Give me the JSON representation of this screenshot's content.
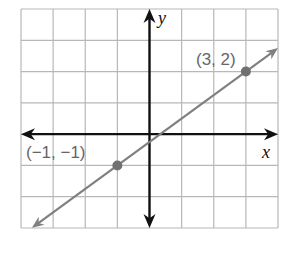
{
  "chart_data": {
    "type": "line",
    "title": "",
    "xlabel": "x",
    "ylabel": "y",
    "xlim": [
      -4,
      4
    ],
    "ylim": [
      -3,
      4
    ],
    "grid": true,
    "axes_arrows": true,
    "series": [
      {
        "name": "line through (-1,-1) and (3,2)",
        "equation": "y = 0.75x - 0.25",
        "slope": 0.75,
        "intercept": -0.25,
        "arrows": "both",
        "color": "#808080",
        "points": [
          {
            "x": -1,
            "y": -1,
            "label": "(−1, −1)"
          },
          {
            "x": 3,
            "y": 2,
            "label": "(3, 2)"
          }
        ]
      }
    ]
  },
  "labels": {
    "x_axis": "x",
    "y_axis": "y",
    "point_a": "(−1, −1)",
    "point_b": "(3, 2)"
  },
  "colors": {
    "grid": "#b8b8b8",
    "axes": "#111111",
    "line": "#808080",
    "point": "#707070",
    "label": "#666666"
  }
}
